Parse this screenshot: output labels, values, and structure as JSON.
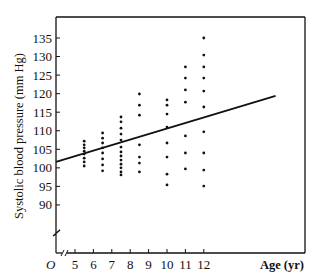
{
  "chart_data": {
    "type": "scatter",
    "title": "",
    "xlabel": "Age (yr)",
    "ylabel": "Systolic blood pressure (mm Hg)",
    "origin_label": "O",
    "x_ticks": [
      5,
      6,
      7,
      8,
      9,
      10,
      11,
      12
    ],
    "y_ticks": [
      90,
      95,
      100,
      105,
      110,
      115,
      120,
      125,
      130,
      135
    ],
    "ylim": [
      88,
      140
    ],
    "xlim": [
      4.4,
      17.5
    ],
    "axis_breaks": {
      "x": true,
      "y": true
    },
    "grid": false,
    "legend": null,
    "series": [
      {
        "name": "observations",
        "points": [
          {
            "x": 5.5,
            "y": 107.2
          },
          {
            "x": 5.5,
            "y": 106.2
          },
          {
            "x": 5.5,
            "y": 105.4
          },
          {
            "x": 5.5,
            "y": 104.5
          },
          {
            "x": 5.5,
            "y": 103.7
          },
          {
            "x": 5.5,
            "y": 102.6
          },
          {
            "x": 5.5,
            "y": 101.6
          },
          {
            "x": 5.5,
            "y": 100.5
          },
          {
            "x": 6.5,
            "y": 109.4
          },
          {
            "x": 6.5,
            "y": 108.0
          },
          {
            "x": 6.5,
            "y": 106.7
          },
          {
            "x": 6.5,
            "y": 105.4
          },
          {
            "x": 6.5,
            "y": 104.0
          },
          {
            "x": 6.5,
            "y": 102.4
          },
          {
            "x": 6.5,
            "y": 100.8
          },
          {
            "x": 6.5,
            "y": 99.2
          },
          {
            "x": 7.5,
            "y": 113.7
          },
          {
            "x": 7.5,
            "y": 112.4
          },
          {
            "x": 7.5,
            "y": 110.7
          },
          {
            "x": 7.5,
            "y": 109.1
          },
          {
            "x": 7.5,
            "y": 107.5
          },
          {
            "x": 7.5,
            "y": 105.6
          },
          {
            "x": 7.5,
            "y": 104.3
          },
          {
            "x": 7.5,
            "y": 103.2
          },
          {
            "x": 7.5,
            "y": 102.1
          },
          {
            "x": 7.5,
            "y": 101.0
          },
          {
            "x": 7.5,
            "y": 100.0
          },
          {
            "x": 7.5,
            "y": 98.9
          },
          {
            "x": 7.5,
            "y": 98.1
          },
          {
            "x": 8.5,
            "y": 119.9
          },
          {
            "x": 8.5,
            "y": 116.9
          },
          {
            "x": 8.5,
            "y": 114.2
          },
          {
            "x": 8.5,
            "y": 106.2
          },
          {
            "x": 8.5,
            "y": 102.9
          },
          {
            "x": 8.5,
            "y": 101.3
          },
          {
            "x": 8.5,
            "y": 98.9
          },
          {
            "x": 10,
            "y": 118.3
          },
          {
            "x": 10,
            "y": 116.9
          },
          {
            "x": 10,
            "y": 114.5
          },
          {
            "x": 10,
            "y": 111.0
          },
          {
            "x": 10,
            "y": 106.7
          },
          {
            "x": 10,
            "y": 102.9
          },
          {
            "x": 10,
            "y": 98.3
          },
          {
            "x": 10,
            "y": 95.4
          },
          {
            "x": 11,
            "y": 127.2
          },
          {
            "x": 11,
            "y": 124.2
          },
          {
            "x": 11,
            "y": 121.0
          },
          {
            "x": 11,
            "y": 117.7
          },
          {
            "x": 11,
            "y": 108.6
          },
          {
            "x": 11,
            "y": 104.0
          },
          {
            "x": 11,
            "y": 99.7
          },
          {
            "x": 12,
            "y": 135.0
          },
          {
            "x": 12,
            "y": 130.4
          },
          {
            "x": 12,
            "y": 127.2
          },
          {
            "x": 12,
            "y": 124.2
          },
          {
            "x": 12,
            "y": 120.7
          },
          {
            "x": 12,
            "y": 116.4
          },
          {
            "x": 12,
            "y": 109.7
          },
          {
            "x": 12,
            "y": 104.0
          },
          {
            "x": 12,
            "y": 99.4
          },
          {
            "x": 12,
            "y": 95.1
          }
        ]
      }
    ],
    "regression_line": {
      "x1": 4.0,
      "y1": 101.6,
      "x2": 15.9,
      "y2": 119.4
    }
  },
  "layout": {
    "plot_left_px": 56,
    "plot_right_px": 305,
    "plot_top_px": 17,
    "x_axis_y_px": 253,
    "x_px_at_5": 75,
    "x_px_per_year": 18.4,
    "y_px_at_135": 38,
    "y_px_per_unit": 3.71
  },
  "colors": {
    "ink": "#111111",
    "background": "#ffffff"
  }
}
